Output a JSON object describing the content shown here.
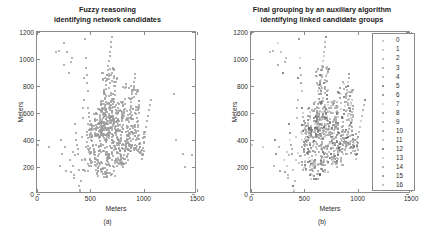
{
  "figure": {
    "panels": [
      {
        "id": "a",
        "caption": "(a)",
        "title_line1": "Fuzzy reasoning",
        "title_line2": "identifying network candidates"
      },
      {
        "id": "b",
        "caption": "(b)",
        "title_line1": "Final grouping by an auxiliary algorithm",
        "title_line2": "identifying linked candidate groups"
      }
    ]
  },
  "axes": {
    "xlabel": "Meters",
    "ylabel": "Meters",
    "xticks": [
      "0",
      "500",
      "1000",
      "1500"
    ],
    "yticks": [
      "0",
      "200",
      "400",
      "600",
      "800",
      "1000",
      "1200"
    ]
  },
  "legend": {
    "items": [
      {
        "label": "0",
        "color": "#b9b9b9"
      },
      {
        "label": "1",
        "color": "#c2c2c2"
      },
      {
        "label": "2",
        "color": "#ababab"
      },
      {
        "label": "3",
        "color": "#9e9e9e"
      },
      {
        "label": "4",
        "color": "#a5a5a5"
      },
      {
        "label": "5",
        "color": "#6b6b6b"
      },
      {
        "label": "6",
        "color": "#7a7a7a"
      },
      {
        "label": "7",
        "color": "#cfcfcf"
      },
      {
        "label": "8",
        "color": "#949494"
      },
      {
        "label": "9",
        "color": "#a0a0a0"
      },
      {
        "label": "10",
        "color": "#8c8c8c"
      },
      {
        "label": "11",
        "color": "#b3b3b3"
      },
      {
        "label": "12",
        "color": "#5f5f5f"
      },
      {
        "label": "13",
        "color": "#c7c7c7"
      },
      {
        "label": "14",
        "color": "#9a9a9a"
      },
      {
        "label": "15",
        "color": "#868686"
      },
      {
        "label": "16",
        "color": "#adadad"
      }
    ]
  },
  "chart_data": {
    "type": "scatter",
    "xlabel": "Meters",
    "ylabel": "Meters",
    "xlim": [
      0,
      1500
    ],
    "ylim": [
      0,
      1200
    ],
    "grid": false,
    "legend_position": "right-inside",
    "marker_color_panel_a": "#9a9a9a",
    "panel_a_series": {
      "name": "network candidates",
      "x": [
        10,
        110,
        175,
        205,
        215,
        225,
        235,
        250,
        255,
        265,
        270,
        285,
        300,
        305,
        315,
        320,
        330,
        335,
        340,
        345,
        350,
        355,
        360,
        365,
        370,
        375,
        380,
        385,
        390,
        395,
        400,
        405,
        410,
        415,
        420,
        425,
        430,
        435,
        440,
        445,
        450,
        455,
        460,
        465,
        470,
        475,
        480,
        485,
        490,
        495,
        500,
        505,
        510,
        515,
        520,
        525,
        530,
        535,
        540,
        545,
        550,
        555,
        560,
        565,
        570,
        575,
        580,
        585,
        590,
        595,
        600,
        605,
        610,
        615,
        620,
        625,
        630,
        635,
        640,
        645,
        650,
        655,
        660,
        665,
        670,
        675,
        680,
        685,
        690,
        695,
        700,
        705,
        710,
        715,
        720,
        725,
        730,
        735,
        740,
        745,
        750,
        755,
        760,
        765,
        770,
        775,
        780,
        785,
        790,
        795,
        800,
        805,
        810,
        815,
        820,
        825,
        830,
        835,
        840,
        845,
        850,
        855,
        860,
        865,
        870,
        875,
        880,
        885,
        890,
        895,
        900,
        905,
        910,
        915,
        920,
        925,
        930,
        935,
        940,
        945,
        950,
        955,
        960,
        965,
        970,
        975,
        980,
        985,
        990,
        995,
        1000,
        1005,
        1010,
        1020,
        1030,
        1040,
        1050,
        1060,
        1070,
        1280,
        1300,
        1370,
        1390,
        1450
      ],
      "y": [
        365,
        345,
        1055,
        1060,
        205,
        400,
        300,
        1120,
        955,
        350,
        170,
        1050,
        900,
        255,
        975,
        165,
        1005,
        310,
        205,
        140,
        120,
        290,
        520,
        455,
        400,
        360,
        330,
        300,
        180,
        60,
        30,
        15,
        5,
        95,
        250,
        420,
        560,
        640,
        700,
        860,
        1150,
        1010,
        935,
        880,
        820,
        760,
        640,
        600,
        570,
        540,
        510,
        480,
        450,
        420,
        390,
        360,
        330,
        300,
        270,
        240,
        210,
        180,
        150,
        220,
        250,
        285,
        320,
        355,
        390,
        425,
        460,
        495,
        530,
        565,
        600,
        635,
        670,
        705,
        740,
        775,
        810,
        845,
        880,
        915,
        950,
        985,
        1020,
        1055,
        1090,
        1125,
        1160,
        600,
        580,
        560,
        540,
        520,
        500,
        480,
        460,
        440,
        420,
        400,
        380,
        360,
        340,
        320,
        300,
        280,
        260,
        240,
        220,
        200,
        230,
        260,
        290,
        320,
        350,
        380,
        410,
        440,
        470,
        500,
        530,
        560,
        590,
        620,
        650,
        680,
        710,
        740,
        770,
        800,
        830,
        860,
        890,
        620,
        590,
        560,
        530,
        500,
        470,
        440,
        410,
        380,
        350,
        320,
        290,
        260,
        300,
        340,
        380,
        420,
        460,
        500,
        540,
        580,
        620,
        660,
        700,
        740,
        400,
        300,
        200,
        290,
        200,
        65,
        290,
        150
      ]
    },
    "panel_b_series": {
      "name": "linked candidate groups (17 clusters, labels 0-16)",
      "note": "Same spatial point set as panel (a), recolored by cluster id 0-16"
    }
  }
}
